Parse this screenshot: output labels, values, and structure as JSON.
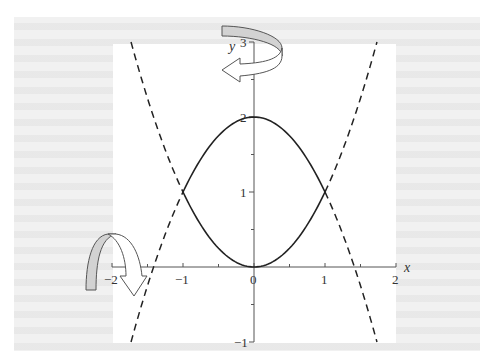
{
  "chart_data": {
    "type": "line",
    "title": "",
    "xlabel": "x",
    "ylabel": "y",
    "xlim": [
      -2,
      2
    ],
    "ylim": [
      -1,
      3
    ],
    "x_ticks": [
      {
        "value": -2,
        "label": "-2"
      },
      {
        "value": -1,
        "label": "-1"
      },
      {
        "value": 0,
        "label": "0"
      },
      {
        "value": 1,
        "label": "1"
      },
      {
        "value": 2,
        "label": "2"
      }
    ],
    "x_minor_ticks": [
      -1.5,
      -0.5,
      0.5,
      1.5
    ],
    "y_ticks": [
      {
        "value": -1,
        "label": "-1"
      },
      {
        "value": 1,
        "label": "1"
      },
      {
        "value": 2,
        "label": "2"
      },
      {
        "value": 3,
        "label": "3"
      }
    ],
    "y_minor_ticks": [
      -0.5,
      0.5,
      1.5,
      2.5
    ],
    "grid": false,
    "legend": null,
    "series": [
      {
        "name": "y = 2 - x^2 (region boundary)",
        "style": "solid",
        "x_range": [
          -1,
          1
        ],
        "points": [
          [
            -1,
            1
          ],
          [
            -0.5,
            1.75
          ],
          [
            0,
            2
          ],
          [
            0.5,
            1.75
          ],
          [
            1,
            1
          ]
        ]
      },
      {
        "name": "y = x^2 (region boundary)",
        "style": "solid",
        "x_range": [
          -1,
          1
        ],
        "points": [
          [
            -1,
            1
          ],
          [
            -0.5,
            0.25
          ],
          [
            0,
            0
          ],
          [
            0.5,
            0.25
          ],
          [
            1,
            1
          ]
        ]
      },
      {
        "name": "y = 2 - x^2 (extension left)",
        "style": "dashed",
        "x_range": [
          -1.732,
          -1
        ],
        "points": [
          [
            -1.732,
            -1
          ],
          [
            -1.414,
            0
          ],
          [
            -1,
            1
          ]
        ]
      },
      {
        "name": "y = 2 - x^2 (extension right)",
        "style": "dashed",
        "x_range": [
          1,
          1.732
        ],
        "points": [
          [
            1,
            1
          ],
          [
            1.414,
            0
          ],
          [
            1.732,
            -1
          ]
        ]
      },
      {
        "name": "y = x^2 (extension left)",
        "style": "dashed",
        "x_range": [
          -1.732,
          -1
        ],
        "points": [
          [
            -1.732,
            3
          ],
          [
            -1.414,
            2
          ],
          [
            -1,
            1
          ]
        ]
      },
      {
        "name": "y = x^2 (extension right)",
        "style": "dashed",
        "x_range": [
          1,
          1.732
        ],
        "points": [
          [
            1,
            1
          ],
          [
            1.414,
            2
          ],
          [
            1.732,
            3
          ]
        ]
      }
    ],
    "annotations": [
      {
        "type": "rotation-arrow",
        "about": "y-axis",
        "position": "top"
      },
      {
        "type": "rotation-arrow",
        "about": "x-axis",
        "position": "left"
      }
    ]
  },
  "colors": {
    "curve": "#222222",
    "axis": "#555555",
    "arrow_shade": "#d2d2d2",
    "arrow_outline": "#555555",
    "page_bg": "#f1f1f1",
    "plot_bg": "#ffffff"
  }
}
